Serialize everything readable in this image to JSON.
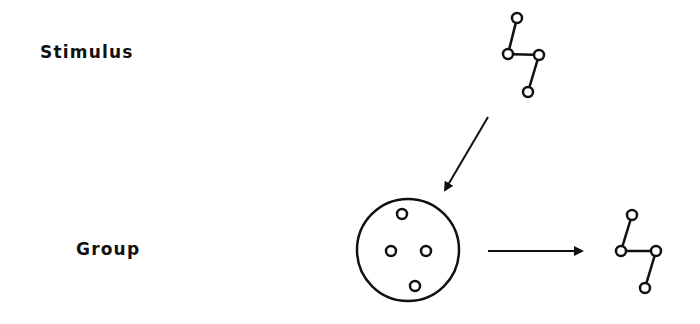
{
  "labels": {
    "stimulus": "Stimulus",
    "group": "Group"
  },
  "colors": {
    "stroke": "#111111",
    "background": "#ffffff"
  },
  "diagram": {
    "stimulus_graph": {
      "nodes": [
        [
          517,
          18
        ],
        [
          508,
          54
        ],
        [
          539,
          55
        ],
        [
          528,
          92
        ]
      ],
      "edges": [
        [
          0,
          1
        ],
        [
          1,
          2
        ],
        [
          2,
          3
        ]
      ]
    },
    "group_circle": {
      "cx": 408,
      "cy": 250,
      "r": 51
    },
    "group_members": [
      [
        402,
        214
      ],
      [
        391,
        251
      ],
      [
        426,
        251
      ],
      [
        415,
        286
      ]
    ],
    "output_graph": {
      "nodes": [
        [
          632,
          215
        ],
        [
          621,
          251
        ],
        [
          656,
          251
        ],
        [
          645,
          288
        ]
      ],
      "edges": [
        [
          0,
          1
        ],
        [
          1,
          2
        ],
        [
          2,
          3
        ]
      ]
    },
    "arrows": [
      {
        "name": "stimulus-to-group",
        "from": [
          488,
          117
        ],
        "to": [
          445,
          190
        ]
      },
      {
        "name": "group-to-output",
        "from": [
          488,
          251
        ],
        "to": [
          582,
          251
        ]
      }
    ]
  }
}
